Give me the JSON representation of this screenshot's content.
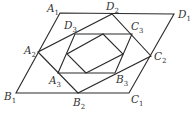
{
  "diagram": {
    "type": "nested-parallelograms",
    "colors": {
      "stroke": "#2b2b2b",
      "label": "#333333",
      "background": "#ffffff"
    },
    "polygons": [
      {
        "name": "A1B1C1D1",
        "points": [
          [
            60,
            13
          ],
          [
            16,
            93
          ],
          [
            129,
            93
          ],
          [
            174,
            14
          ]
        ]
      },
      {
        "name": "A2B2C2D2",
        "points": [
          [
            38,
            52
          ],
          [
            78,
            93
          ],
          [
            151,
            56
          ],
          [
            112,
            14
          ]
        ]
      },
      {
        "name": "A3B3C3D3",
        "points": [
          [
            58,
            73
          ],
          [
            115,
            73
          ],
          [
            132,
            34
          ],
          [
            75,
            34
          ]
        ]
      },
      {
        "name": "inner-midpoint-quad",
        "points": [
          [
            86,
            73
          ],
          [
            123,
            54
          ],
          [
            103,
            34
          ],
          [
            67,
            54
          ]
        ]
      }
    ],
    "labels": [
      {
        "id": "A1",
        "letter": "A",
        "sub": "1",
        "x": 47,
        "y": 12
      },
      {
        "id": "D2",
        "letter": "D",
        "sub": "2",
        "x": 106,
        "y": 10
      },
      {
        "id": "D1",
        "letter": "D",
        "sub": "1",
        "x": 178,
        "y": 18
      },
      {
        "id": "D3",
        "letter": "D",
        "sub": "3",
        "x": 64,
        "y": 29
      },
      {
        "id": "C3",
        "letter": "C",
        "sub": "3",
        "x": 131,
        "y": 30
      },
      {
        "id": "A2",
        "letter": "A",
        "sub": "2",
        "x": 24,
        "y": 54
      },
      {
        "id": "C2",
        "letter": "C",
        "sub": "2",
        "x": 154,
        "y": 60
      },
      {
        "id": "A3",
        "letter": "A",
        "sub": "3",
        "x": 49,
        "y": 84
      },
      {
        "id": "B3",
        "letter": "B",
        "sub": "3",
        "x": 116,
        "y": 83
      },
      {
        "id": "B1",
        "letter": "B",
        "sub": "1",
        "x": 4,
        "y": 100
      },
      {
        "id": "B2",
        "letter": "B",
        "sub": "2",
        "x": 73,
        "y": 106
      },
      {
        "id": "C1",
        "letter": "C",
        "sub": "1",
        "x": 131,
        "y": 103
      }
    ]
  }
}
